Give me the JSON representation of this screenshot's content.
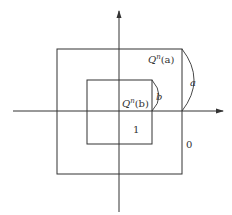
{
  "diagram": {
    "labels": {
      "outer_square": "Q",
      "outer_square_sup": "n",
      "outer_square_arg": "(a)",
      "outer_arc": "a",
      "inner_square": "Q",
      "inner_square_sup": "n",
      "inner_square_arg": "(b)",
      "inner_arc": "b",
      "inner_region": "1",
      "outer_region": "0"
    },
    "colors": {
      "stroke": "#333333",
      "background": "#ffffff"
    }
  }
}
